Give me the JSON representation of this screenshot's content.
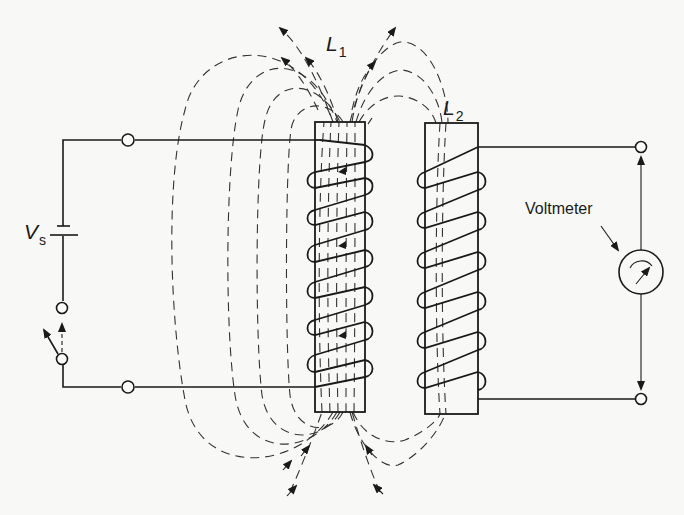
{
  "diagram": {
    "type": "mutual-inductance-circuit",
    "labels": {
      "source": {
        "main": "V",
        "sub": "s"
      },
      "coil1": {
        "main": "L",
        "sub": "1"
      },
      "coil2": {
        "main": "L",
        "sub": "2"
      },
      "meter": "Voltmeter"
    },
    "components": [
      {
        "id": "source",
        "kind": "dc-voltage-source",
        "label": "Vs"
      },
      {
        "id": "switch",
        "kind": "switch",
        "state": "open"
      },
      {
        "id": "coil1",
        "kind": "inductor",
        "label": "L1",
        "turns": 6
      },
      {
        "id": "coil2",
        "kind": "inductor",
        "label": "L2",
        "turns": 6
      },
      {
        "id": "meter",
        "kind": "voltmeter",
        "label": "Voltmeter"
      }
    ],
    "field_lines": {
      "style": "dashed",
      "direction": "upward through L1, looping around both coils"
    },
    "colors": {
      "ink": "#1a1a1a",
      "background": "#f8f8f6"
    }
  }
}
